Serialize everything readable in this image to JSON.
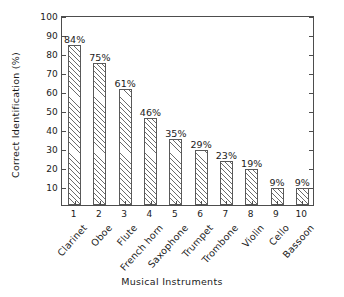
{
  "chart_data": {
    "type": "bar",
    "title": "",
    "xlabel": "Musical Instruments",
    "ylabel": "Correct Identification (%)",
    "categories": [
      "Clarinet",
      "Oboe",
      "Flute",
      "French horn",
      "Saxophone",
      "Trumpet",
      "Trombone",
      "Violin",
      "Cello",
      "Bassoon"
    ],
    "x_tick_labels": [
      "1",
      "2",
      "3",
      "4",
      "5",
      "6",
      "7",
      "8",
      "9",
      "10"
    ],
    "values": [
      84,
      75,
      61,
      46,
      35,
      29,
      23,
      19,
      9,
      9
    ],
    "value_labels": [
      "84%",
      "75%",
      "61%",
      "46%",
      "35%",
      "29%",
      "23%",
      "19%",
      "9%",
      "9%"
    ],
    "ylim": [
      0,
      100
    ],
    "y_tick_labels": [
      "10",
      "20",
      "30",
      "40",
      "50",
      "60",
      "70",
      "80",
      "90",
      "100"
    ],
    "y_tick_values": [
      10,
      20,
      30,
      40,
      50,
      60,
      70,
      80,
      90,
      100
    ],
    "grid": false,
    "legend": false,
    "bar_fill": "hatch-diagonal",
    "colors": {
      "background": "#ffffff",
      "axis": "#4d4d4d",
      "bar_edge": "#595959",
      "hatch": "#6b6b6b",
      "text": "#1a1a1a"
    }
  }
}
